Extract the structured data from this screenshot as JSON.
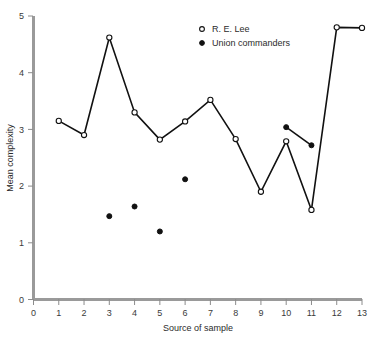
{
  "chart_data": {
    "type": "scatter",
    "title": "",
    "xlabel": "Source of sample",
    "ylabel": "Mean complexity",
    "xlim": [
      0,
      13
    ],
    "ylim": [
      0,
      5
    ],
    "xticks": [
      0,
      1,
      2,
      3,
      4,
      5,
      6,
      7,
      8,
      9,
      10,
      11,
      12,
      13
    ],
    "yticks": [
      0,
      1,
      2,
      3,
      4,
      5
    ],
    "grid": false,
    "legend_position": "top-center",
    "series": [
      {
        "name": "R. E. Lee",
        "marker": "open-circle",
        "connected": true,
        "x": [
          1,
          2,
          3,
          4,
          5,
          6,
          7,
          8,
          9,
          10,
          11,
          12,
          13
        ],
        "values": [
          3.15,
          2.9,
          4.62,
          3.3,
          2.82,
          3.14,
          3.52,
          2.83,
          1.9,
          2.79,
          1.58,
          4.8,
          4.79
        ]
      },
      {
        "name": "Union commanders",
        "marker": "filled-circle",
        "connected": false,
        "connected_pairs": [
          [
            10,
            11
          ]
        ],
        "x": [
          3,
          4,
          5,
          6,
          10,
          11
        ],
        "values": [
          1.47,
          1.64,
          1.2,
          2.12,
          3.04,
          2.72
        ]
      }
    ]
  },
  "axes": {
    "y_title": "Mean complexity",
    "x_title": "Source of sample",
    "y_tick_labels": [
      "0",
      "1",
      "2",
      "3",
      "4",
      "5"
    ],
    "x_tick_labels": [
      "0",
      "1",
      "2",
      "3",
      "4",
      "5",
      "6",
      "7",
      "8",
      "9",
      "10",
      "11",
      "12",
      "13"
    ]
  },
  "legend": {
    "entries": [
      {
        "label": "R. E. Lee",
        "marker": "open-circle"
      },
      {
        "label": "Union commanders",
        "marker": "filled-circle"
      }
    ]
  },
  "colors": {
    "line": "#111111",
    "axis": "#9a9a9a",
    "text": "#2b2b2b",
    "background": "#ffffff"
  }
}
